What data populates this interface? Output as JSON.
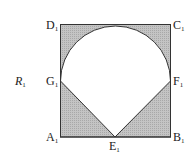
{
  "figure": {
    "name": "R",
    "name_subscript": "1",
    "colors": {
      "shade": "#b8b8b8",
      "stroke": "#333333",
      "background": "#ffffff"
    },
    "points": {
      "A": {
        "label": "A",
        "sub": "1"
      },
      "B": {
        "label": "B",
        "sub": "1"
      },
      "C": {
        "label": "C",
        "sub": "1"
      },
      "D": {
        "label": "D",
        "sub": "1"
      },
      "E": {
        "label": "E",
        "sub": "1"
      },
      "F": {
        "label": "F",
        "sub": "1"
      },
      "G": {
        "label": "G",
        "sub": "1"
      }
    }
  }
}
